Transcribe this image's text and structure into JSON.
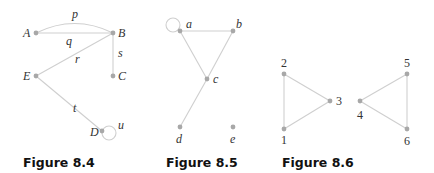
{
  "figures": [
    {
      "caption": "Figure 8.4",
      "nodes": [
        {
          "id": "A",
          "label": "A",
          "x": 36,
          "y": 33
        },
        {
          "id": "B",
          "label": "B",
          "x": 113,
          "y": 33
        },
        {
          "id": "C",
          "label": "C",
          "x": 113,
          "y": 76
        },
        {
          "id": "E",
          "label": "E",
          "x": 36,
          "y": 76
        },
        {
          "id": "D",
          "label": "D",
          "x": 102,
          "y": 131
        }
      ],
      "edges": [
        {
          "label": "p",
          "from": "A",
          "to": "B",
          "shape": "arc"
        },
        {
          "label": "q",
          "from": "A",
          "to": "B",
          "shape": "line"
        },
        {
          "label": "r",
          "from": "E",
          "to": "B",
          "shape": "line"
        },
        {
          "label": "s",
          "from": "B",
          "to": "C",
          "shape": "line"
        },
        {
          "label": "t",
          "from": "E",
          "to": "D",
          "shape": "line"
        },
        {
          "label": "u",
          "from": "D",
          "to": "D",
          "shape": "loop"
        }
      ]
    },
    {
      "caption": "Figure 8.5",
      "nodes": [
        {
          "id": "a",
          "label": "a",
          "x": 180,
          "y": 31
        },
        {
          "id": "b",
          "label": "b",
          "x": 233,
          "y": 31
        },
        {
          "id": "c",
          "label": "c",
          "x": 207,
          "y": 79
        },
        {
          "id": "d",
          "label": "d",
          "x": 180,
          "y": 127
        },
        {
          "id": "e",
          "label": "e",
          "x": 233,
          "y": 127
        }
      ],
      "edges": [
        {
          "from": "a",
          "to": "a",
          "shape": "loop"
        },
        {
          "from": "a",
          "to": "b",
          "shape": "line"
        },
        {
          "from": "a",
          "to": "c",
          "shape": "line"
        },
        {
          "from": "b",
          "to": "c",
          "shape": "line"
        },
        {
          "from": "c",
          "to": "d",
          "shape": "line"
        }
      ]
    },
    {
      "caption": "Figure 8.6",
      "nodes": [
        {
          "id": "1",
          "label": "1",
          "x": 284,
          "y": 129
        },
        {
          "id": "2",
          "label": "2",
          "x": 284,
          "y": 74
        },
        {
          "id": "3",
          "label": "3",
          "x": 330,
          "y": 101
        },
        {
          "id": "4",
          "label": "4",
          "x": 360,
          "y": 101
        },
        {
          "id": "5",
          "label": "5",
          "x": 407,
          "y": 74
        },
        {
          "id": "6",
          "label": "6",
          "x": 407,
          "y": 129
        }
      ],
      "edges": [
        {
          "from": "1",
          "to": "2",
          "shape": "line"
        },
        {
          "from": "2",
          "to": "3",
          "shape": "line"
        },
        {
          "from": "1",
          "to": "3",
          "shape": "line"
        },
        {
          "from": "4",
          "to": "5",
          "shape": "line"
        },
        {
          "from": "5",
          "to": "6",
          "shape": "line"
        },
        {
          "from": "4",
          "to": "6",
          "shape": "line"
        }
      ]
    }
  ],
  "labels": {
    "A": "A",
    "B": "B",
    "C": "C",
    "D": "D",
    "E": "E",
    "p": "p",
    "q": "q",
    "r": "r",
    "s": "s",
    "t": "t",
    "u": "u",
    "a": "a",
    "b": "b",
    "c": "c",
    "d": "d",
    "e": "e",
    "n1": "1",
    "n2": "2",
    "n3": "3",
    "n4": "4",
    "n5": "5",
    "n6": "6"
  }
}
